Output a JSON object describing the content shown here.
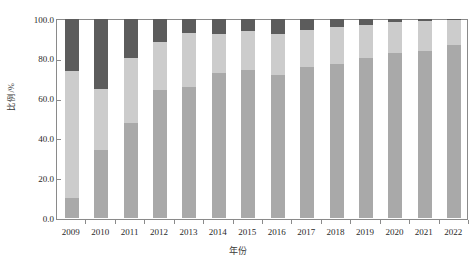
{
  "chart_data": {
    "type": "bar",
    "subtype": "stacked-percent",
    "title": "",
    "xlabel": "年份",
    "ylabel": "比例/%",
    "ylim": [
      0,
      100
    ],
    "yticks": [
      "0.0",
      "20.0",
      "40.0",
      "60.0",
      "80.0",
      "100.0"
    ],
    "ytick_values": [
      0,
      20,
      40,
      60,
      80,
      100
    ],
    "grid": false,
    "legend": "none",
    "categories": [
      "2009",
      "2010",
      "2011",
      "2012",
      "2013",
      "2014",
      "2015",
      "2016",
      "2017",
      "2018",
      "2019",
      "2020",
      "2021",
      "2022"
    ],
    "series": [
      {
        "name": "series-1",
        "color": "#a9a9a9",
        "values": [
          10.2,
          34.0,
          47.8,
          64.5,
          66.0,
          73.0,
          74.5,
          72.0,
          76.0,
          77.5,
          80.5,
          83.0,
          84.0,
          87.0
        ]
      },
      {
        "name": "series-2",
        "color": "#cccccc",
        "values": [
          63.8,
          30.8,
          32.7,
          24.0,
          27.0,
          19.5,
          19.5,
          20.5,
          18.5,
          18.5,
          16.5,
          15.5,
          15.0,
          12.5
        ]
      },
      {
        "name": "series-3",
        "color": "#5c5c5c",
        "values": [
          26.0,
          35.2,
          19.5,
          11.5,
          7.0,
          7.5,
          6.0,
          7.5,
          5.5,
          4.0,
          3.0,
          1.5,
          1.0,
          0.5
        ]
      }
    ],
    "cumulative_tops": [
      [
        10.2,
        74.0,
        100.0
      ],
      [
        34.0,
        64.8,
        100.0
      ],
      [
        47.8,
        80.5,
        100.0
      ],
      [
        64.5,
        88.5,
        100.0
      ],
      [
        66.0,
        93.0,
        100.0
      ],
      [
        73.0,
        92.5,
        100.0
      ],
      [
        74.5,
        94.0,
        100.0
      ],
      [
        72.0,
        92.5,
        100.0
      ],
      [
        76.0,
        94.5,
        100.0
      ],
      [
        77.5,
        96.0,
        100.0
      ],
      [
        80.5,
        97.0,
        100.0
      ],
      [
        83.0,
        98.5,
        100.0
      ],
      [
        84.0,
        99.0,
        100.0
      ],
      [
        87.0,
        99.5,
        100.0
      ]
    ]
  },
  "axis": {
    "y_title": "比例/%",
    "x_title": "年份",
    "frame_color": "#8a8a8a"
  },
  "colors": {
    "series_1": "#a9a9a9",
    "series_2": "#cccccc",
    "series_3": "#5c5c5c",
    "axis": "#8a8a8a",
    "text": "#2a2a2a",
    "background": "#ffffff"
  }
}
